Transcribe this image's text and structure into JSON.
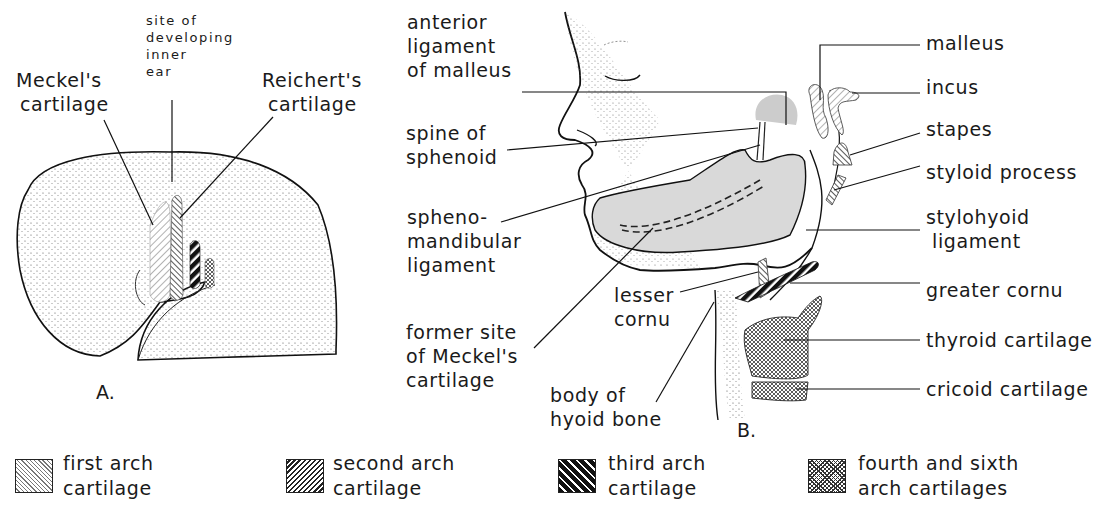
{
  "figure": {
    "panel_a": {
      "letter": "A.",
      "labels": {
        "meckels": [
          "Meckel's",
          "cartilage"
        ],
        "inner_ear": [
          "site of",
          "developing",
          "inner",
          "ear"
        ],
        "reicherts": [
          "Reichert's",
          "cartilage"
        ]
      }
    },
    "panel_b": {
      "letter": "B.",
      "labels_left": {
        "anterior_ligament": [
          "anterior",
          "ligament",
          "of malleus"
        ],
        "spine_sphenoid": [
          "spine of",
          "sphenoid"
        ],
        "sphenomandibular": [
          "spheno-",
          "mandibular",
          "ligament"
        ],
        "lesser_cornu": [
          "lesser",
          "cornu"
        ],
        "former_site": [
          "former site",
          "of Meckel's",
          "cartilage"
        ],
        "body_hyoid": [
          "body of",
          "hyoid bone"
        ]
      },
      "labels_right": {
        "malleus": "malleus",
        "incus": "incus",
        "stapes": "stapes",
        "styloid": "styloid process",
        "stylohyoid": [
          "stylohyoid",
          "ligament"
        ],
        "greater_cornu": "greater cornu",
        "thyroid": "thyroid cartilage",
        "cricoid": "cricoid cartilage"
      }
    },
    "legend": [
      {
        "pattern": "fine-diagonal-hatch",
        "lines": [
          "first arch",
          "cartilage"
        ]
      },
      {
        "pattern": "dense-diagonal-hatch",
        "lines": [
          "second arch",
          "cartilage"
        ]
      },
      {
        "pattern": "bold-black-stripes",
        "lines": [
          "third arch",
          "cartilage"
        ]
      },
      {
        "pattern": "crosshatch",
        "lines": [
          "fourth and sixth",
          "arch cartilages"
        ]
      }
    ]
  }
}
